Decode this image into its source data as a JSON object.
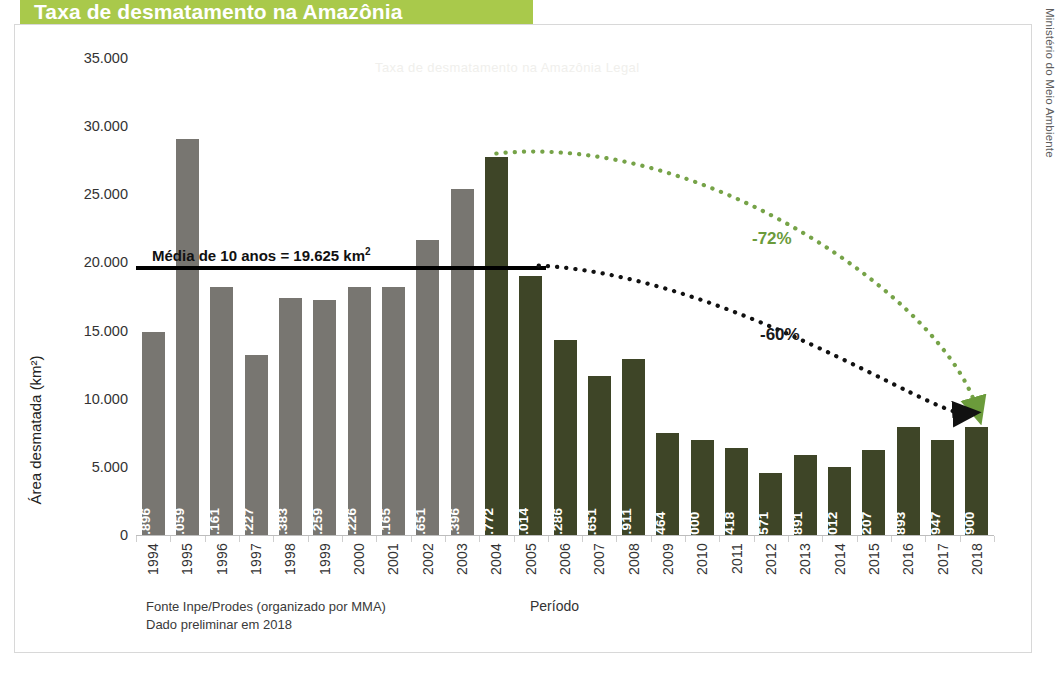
{
  "title": "Taxa de desmatamento na Amazônia",
  "side_credit": "Ministério do Meio Ambiente",
  "ghost_text": "Taxa de desmatamento na Amazônia Legal",
  "footnote": {
    "line1": "Fonte Inpe/Prodes (organizado por MMA)",
    "line2": "Dado preliminar em 2018"
  },
  "average": {
    "label": "Média de 10 anos = 19.625 km",
    "superscript": "2",
    "value": 19625
  },
  "annotations": [
    {
      "name": "green-arrow-label",
      "text": "-72%",
      "color": "#6b9b3b"
    },
    {
      "name": "black-arrow-label",
      "text": "-60%",
      "color": "#1a1a1a"
    }
  ],
  "colors": {
    "banner": "#a9c94b",
    "bar_gray": "#787671",
    "bar_green": "#3e4527",
    "avg_line": "#000000",
    "frame": "#d8d8d8"
  },
  "chart_data": {
    "type": "bar",
    "title": "Taxa de desmatamento na Amazônia",
    "xlabel": "Período",
    "ylabel": "Área desmatada (km²)",
    "ylim": [
      0,
      35000
    ],
    "yticks": [
      0,
      5000,
      10000,
      15000,
      20000,
      25000,
      30000,
      35000
    ],
    "ytick_labels": [
      "0",
      "5.000",
      "10.000",
      "15.000",
      "20.000",
      "25.000",
      "30.000",
      "35.000"
    ],
    "grid": false,
    "legend": "none",
    "categories": [
      "1994",
      "1995",
      "1996",
      "1997",
      "1998",
      "1999",
      "2000",
      "2001",
      "2002",
      "2003",
      "2004",
      "2005",
      "2006",
      "2007",
      "2008",
      "2009",
      "2010",
      "2011",
      "2012",
      "2013",
      "2014",
      "2015",
      "2016",
      "2017",
      "2018"
    ],
    "values": [
      14896,
      29059,
      18161,
      13227,
      17383,
      17259,
      18226,
      18165,
      21651,
      25396,
      27772,
      19014,
      14286,
      11651,
      12911,
      7464,
      7000,
      6418,
      4571,
      5891,
      5012,
      6207,
      7893,
      6947,
      7900
    ],
    "value_labels": [
      "14.896",
      "29.059",
      "18.161",
      "13.227",
      "17.383",
      "17.259",
      "18.226",
      "18.165",
      "21.651",
      "25.396",
      "27.772",
      "19.014",
      "14.286",
      "11.651",
      "12.911",
      "7.464",
      "7.000",
      "6.418",
      "4.571",
      "5.891",
      "5.012",
      "6.207",
      "7.893",
      "6.947",
      "7.900"
    ],
    "bar_colors": [
      "gray",
      "gray",
      "gray",
      "gray",
      "gray",
      "gray",
      "gray",
      "gray",
      "gray",
      "gray",
      "green",
      "green",
      "green",
      "green",
      "green",
      "green",
      "green",
      "green",
      "green",
      "green",
      "green",
      "green",
      "green",
      "green",
      "green"
    ],
    "reference_line": {
      "label": "Média de 10 anos = 19.625 km²",
      "value": 19625
    },
    "annotations": [
      {
        "text": "-72%",
        "from_category": "2004",
        "from_value": 27772,
        "to_category": "2018",
        "to_value": 7900,
        "color": "#6b9b3b"
      },
      {
        "text": "-60%",
        "from_category": "2005",
        "from_value": 19625,
        "to_category": "2018",
        "to_value": 7900,
        "color": "#1a1a1a"
      }
    ]
  }
}
